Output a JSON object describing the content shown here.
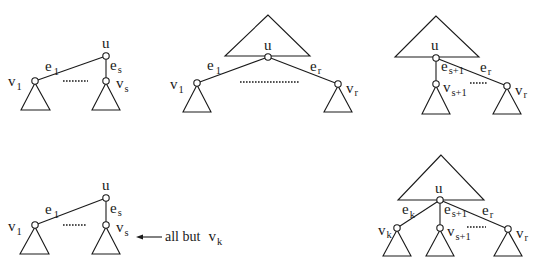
{
  "diagram": {
    "panels": [
      {
        "id": "top-left",
        "root_label": "u",
        "edges": [
          {
            "base": "e",
            "sub": "1"
          },
          {
            "base": "e",
            "sub": "s"
          }
        ],
        "children": [
          {
            "base": "v",
            "sub": "1"
          },
          {
            "base": "v",
            "sub": "s"
          }
        ]
      },
      {
        "id": "top-middle",
        "root_label": "u",
        "edges": [
          {
            "base": "e",
            "sub": "1"
          },
          {
            "base": "e",
            "sub": "r"
          }
        ],
        "children": [
          {
            "base": "v",
            "sub": "1"
          },
          {
            "base": "v",
            "sub": "r"
          }
        ]
      },
      {
        "id": "top-right",
        "root_label": "u",
        "edges": [
          {
            "base": "e",
            "sub": "s+1"
          },
          {
            "base": "e",
            "sub": "r"
          }
        ],
        "children": [
          {
            "base": "v",
            "sub": "s+1"
          },
          {
            "base": "v",
            "sub": "r"
          }
        ]
      },
      {
        "id": "bottom-left",
        "root_label": "u",
        "edges": [
          {
            "base": "e",
            "sub": "1"
          },
          {
            "base": "e",
            "sub": "s"
          }
        ],
        "children": [
          {
            "base": "v",
            "sub": "1"
          },
          {
            "base": "v",
            "sub": "s"
          }
        ],
        "annotation": {
          "text": "all but",
          "base": "v",
          "sub": "k"
        }
      },
      {
        "id": "bottom-right",
        "root_label": "u",
        "edges": [
          {
            "base": "e",
            "sub": "k"
          },
          {
            "base": "e",
            "sub": "s+1"
          },
          {
            "base": "e",
            "sub": "r"
          }
        ],
        "children": [
          {
            "base": "v",
            "sub": "k"
          },
          {
            "base": "v",
            "sub": "s+1"
          },
          {
            "base": "v",
            "sub": "r"
          }
        ]
      }
    ]
  }
}
